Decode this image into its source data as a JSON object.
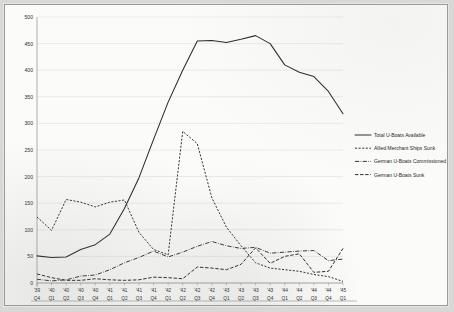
{
  "chart_data": {
    "type": "line",
    "title": "",
    "subtitle": "",
    "xlabel": "",
    "ylabel": "",
    "ylim": [
      0,
      500
    ],
    "ytick_step": 50,
    "yticks": [
      0,
      50,
      100,
      150,
      200,
      250,
      300,
      350,
      400,
      450,
      500
    ],
    "grid": "horizontal",
    "legend_position": "right",
    "x": [
      "'39 Q4",
      "'40 Q1",
      "'40 Q2",
      "'40 Q3",
      "'40 Q4",
      "'41 Q1",
      "'41 Q2",
      "'41 Q3",
      "'41 Q4",
      "'42 Q1",
      "'42 Q2",
      "'42 Q3",
      "'42 Q4",
      "'43 Q1",
      "'43 Q2",
      "'43 Q3",
      "'43 Q4",
      "'44 Q1",
      "'44 Q2",
      "'44 Q3",
      "'44 Q4",
      "'45 Q1"
    ],
    "x_year_labels": [
      "'39",
      "'40",
      "'40",
      "'40",
      "'40",
      "'41",
      "'41",
      "'41",
      "'41",
      "'42",
      "'42",
      "'42",
      "'42",
      "'43",
      "'43",
      "'43",
      "'43",
      "'44",
      "'44",
      "'44",
      "'44",
      "'45"
    ],
    "x_quarter_labels": [
      "Q4",
      "Q1",
      "Q2",
      "Q3",
      "Q4",
      "Q1",
      "Q2",
      "Q3",
      "Q4",
      "Q1",
      "Q2",
      "Q3",
      "Q4",
      "Q1",
      "Q2",
      "Q3",
      "Q4",
      "Q1",
      "Q2",
      "Q3",
      "Q4",
      "Q1"
    ],
    "series": [
      {
        "name": "Total U-Boats Available",
        "style": "solid",
        "values": [
          51,
          48,
          49,
          63,
          72,
          92,
          140,
          198,
          270,
          340,
          400,
          455,
          456,
          452,
          458,
          465,
          450,
          410,
          396,
          388,
          360,
          318
        ]
      },
      {
        "name": "Allied Merchant Ships Sunk",
        "style": "fine-dash",
        "values": [
          124,
          99,
          157,
          152,
          143,
          152,
          156,
          95,
          63,
          53,
          285,
          262,
          160,
          105,
          70,
          38,
          28,
          25,
          22,
          16,
          12,
          3
        ]
      },
      {
        "name": "German U-Boats Commissioned",
        "style": "dash-dot",
        "values": [
          7,
          4,
          6,
          13,
          15,
          25,
          38,
          48,
          60,
          49,
          58,
          69,
          78,
          70,
          65,
          67,
          56,
          58,
          60,
          61,
          42,
          45
        ]
      },
      {
        "name": "German U-Boats Sunk",
        "style": "medium-dash",
        "values": [
          17,
          10,
          5,
          5,
          8,
          6,
          5,
          6,
          11,
          10,
          8,
          30,
          28,
          25,
          35,
          66,
          37,
          50,
          55,
          20,
          22,
          65
        ]
      }
    ],
    "legend": [
      {
        "label": "Total U-Boats Available",
        "style": "solid"
      },
      {
        "label": "Allied Merchant Ships Sunk",
        "style": "fine-dash"
      },
      {
        "label": "German U-Boats Commissioned",
        "style": "dash-dot"
      },
      {
        "label": "German U-Boats Sunk",
        "style": "medium-dash"
      }
    ],
    "colors": {
      "line": "#2a2a2a",
      "grid": "#d9d9d7",
      "axis": "#8d8d8b",
      "plot_background": "#fbfbfa",
      "page_background": "#d8d8d6"
    }
  }
}
